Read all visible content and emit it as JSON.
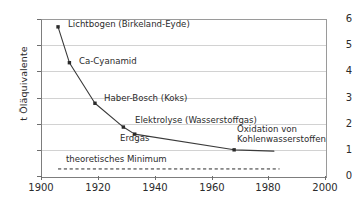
{
  "chart_data": {
    "type": "line",
    "title": "",
    "subtitle": "",
    "xlabel": "",
    "ylabel": "t Öläquivalente",
    "xlim": [
      1900,
      2000
    ],
    "ylim": [
      0,
      6
    ],
    "xticks": [
      1900,
      1920,
      1940,
      1960,
      1980,
      2000
    ],
    "xtick_labels": [
      "1900",
      "1920",
      "1940",
      "1960",
      "1980",
      "2000"
    ],
    "yticks": [
      0,
      1,
      2,
      3,
      4,
      5,
      6
    ],
    "ytick_labels": [
      "0",
      "1",
      "2",
      "3",
      "4",
      "5",
      "6"
    ],
    "grid": "horizontal",
    "legend": "none",
    "marker": "square",
    "line_color": "#3a3a3a",
    "marker_color": "#2b2b2b",
    "grid_color": "#d2d2d2",
    "axis_color": "#7d7d7d",
    "series": [
      {
        "name": "Energiebedarf Ammoniaksynthese",
        "x": [
          1906,
          1910,
          1919,
          1929,
          1933,
          1968,
          1982
        ],
        "y": [
          5.7,
          4.33,
          2.78,
          1.87,
          1.6,
          1.0,
          0.95
        ],
        "point_labels": [
          "Lichtbogen (Birkeland-Eyde)",
          "Ca-Cyanamid",
          "Haber-Bosch (Koks)",
          "Elektrolyse (Wasserstoffgas)",
          "Erdgas",
          "Oxidation von Kohlenwasserstoffen",
          ""
        ]
      }
    ],
    "reference_line": {
      "label": "theoretisches Minimum",
      "value": 0.27,
      "x_start": 1906,
      "x_end": 1984,
      "style": "dashed"
    },
    "annotations": [
      {
        "text": "Lichtbogen (Birkeland-Eyde)",
        "x": 1906,
        "y": 5.7
      },
      {
        "text": "Ca-Cyanamid",
        "x": 1910,
        "y": 4.33
      },
      {
        "text": "Haber-Bosch (Koks)",
        "x": 1919,
        "y": 2.78
      },
      {
        "text": "Elektrolyse (Wasserstoffgas)",
        "x": 1929,
        "y": 1.87
      },
      {
        "text": "Erdgas",
        "x": 1933,
        "y": 1.6
      },
      {
        "text": "Oxidation von Kohlenwasserstoffen",
        "x": 1968,
        "y": 1.0
      },
      {
        "text": "theoretisches Minimum",
        "x": 1906,
        "y": 0.27
      }
    ]
  },
  "labels": {
    "y_axis_title": "t Öläquivalente",
    "lichtbogen": "Lichtbogen (Birkeland-Eyde)",
    "ca_cyanamid": "Ca-Cyanamid",
    "haber_bosch": "Haber-Bosch (Koks)",
    "elektrolyse": "Elektrolyse (Wasserstoffgas)",
    "erdgas": "Erdgas",
    "oxidation_line1": "Oxidation von",
    "oxidation_line2": "Kohlenwasserstoffen",
    "theoretisches_minimum": "theoretisches Minimum"
  },
  "axes": {
    "y": {
      "t6": "6",
      "t5": "5",
      "t4": "4",
      "t3": "3",
      "t2": "2",
      "t1": "1",
      "t0": "0"
    },
    "x": {
      "t1900": "1900",
      "t1920": "1920",
      "t1940": "1940",
      "t1960": "1960",
      "t1980": "1980",
      "t2000": "2000"
    }
  }
}
